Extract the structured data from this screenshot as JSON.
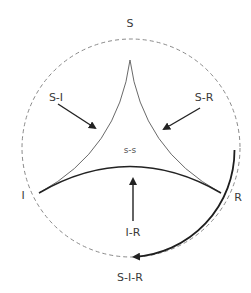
{
  "diagram": {
    "type": "state-transition",
    "nodes": {
      "top": "S",
      "left": "I",
      "right": "R",
      "bottom": "S-I-R",
      "center": "s-s"
    },
    "edges": {
      "s_i": "S-I",
      "s_r": "S-R",
      "i_r": "I-R"
    },
    "colors": {
      "stroke": "#2a2a2a",
      "dashed_circle": "#888888",
      "text": "#3a3a3a",
      "background": "#ffffff"
    }
  }
}
